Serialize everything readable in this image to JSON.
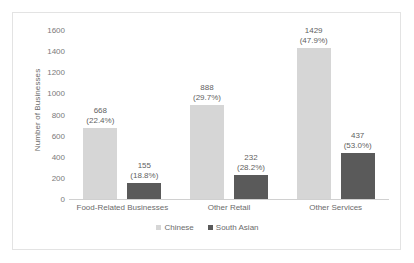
{
  "chart_data": {
    "type": "bar",
    "title": "",
    "xlabel": "",
    "ylabel": "Number of Businesses",
    "ylim": [
      0,
      1600
    ],
    "ytick_labels": [
      "1600",
      "1400",
      "1200",
      "1000",
      "800",
      "600",
      "400",
      "200",
      "0"
    ],
    "ytick_values": [
      1600,
      1400,
      1200,
      1000,
      800,
      600,
      400,
      200,
      0
    ],
    "grid": false,
    "legend_position": "bottom",
    "categories": [
      "Food-Related Businesses",
      "Other Retail",
      "Other Services"
    ],
    "series": [
      {
        "name": "Chinese",
        "color": "#d6d6d6",
        "values": [
          668,
          888,
          1429
        ],
        "labels": [
          "668",
          "888",
          "1429"
        ],
        "percent_labels": [
          "(22.4%)",
          "(29.7%)",
          "(47.9%)"
        ]
      },
      {
        "name": "South Asian",
        "color": "#5a5a5a",
        "values": [
          155,
          232,
          437
        ],
        "labels": [
          "155",
          "232",
          "437"
        ],
        "percent_labels": [
          "(18.8%)",
          "(28.2%)",
          "(53.0%)"
        ]
      }
    ]
  },
  "legend": {
    "items": [
      {
        "label": "Chinese"
      },
      {
        "label": "South Asian"
      }
    ]
  }
}
